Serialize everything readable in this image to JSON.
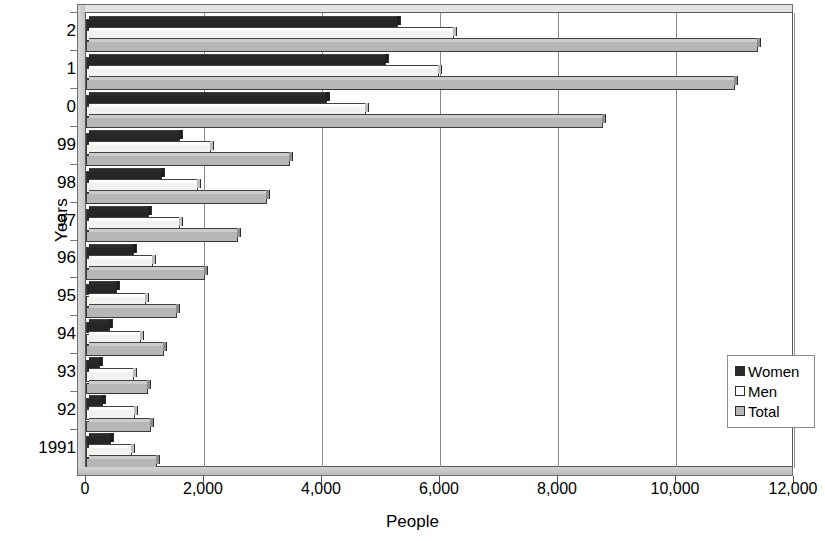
{
  "chart_data": {
    "type": "bar",
    "orientation": "horizontal",
    "title": "",
    "xlabel": "People",
    "ylabel": "Years",
    "xlim": [
      0,
      12000
    ],
    "xticks": [
      "0",
      "2,000",
      "4,000",
      "6,000",
      "8,000",
      "10,000",
      "12,000"
    ],
    "xtick_values": [
      0,
      2000,
      4000,
      6000,
      8000,
      10000,
      12000
    ],
    "grid": true,
    "legend_position": "bottom-right",
    "categories": [
      "1991",
      "92",
      "93",
      "94",
      "95",
      "96",
      "97",
      "98",
      "99",
      "0",
      "1",
      "2"
    ],
    "series": [
      {
        "name": "Women",
        "color": "#262626",
        "values": [
          430,
          280,
          230,
          400,
          530,
          820,
          1060,
          1280,
          1590,
          4090,
          5090,
          5290
        ]
      },
      {
        "name": "Men",
        "color": "#f2f2f0",
        "values": [
          780,
          830,
          820,
          930,
          1020,
          1140,
          1600,
          1890,
          2120,
          4750,
          5990,
          6240
        ]
      },
      {
        "name": "Total",
        "color": "#b6b6b6",
        "values": [
          1210,
          1110,
          1050,
          1330,
          1550,
          2020,
          2570,
          3060,
          3460,
          8760,
          11000,
          11390
        ]
      }
    ]
  },
  "legend": {
    "items": [
      {
        "label": "Women",
        "swatch": "swatch-women"
      },
      {
        "label": "Men",
        "swatch": "swatch-men"
      },
      {
        "label": "Total",
        "swatch": "swatch-total"
      }
    ]
  }
}
